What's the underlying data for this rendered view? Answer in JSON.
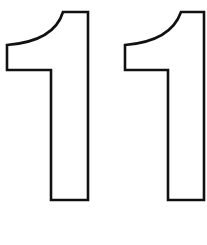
{
  "image": {
    "text": "11",
    "description": "Outlined number eleven, black stroke on white, coloring-page style",
    "colors": {
      "stroke": "#111111",
      "fill": "#ffffff",
      "background": "#ffffff"
    },
    "digits": [
      {
        "char": "1"
      },
      {
        "char": "1"
      }
    ]
  }
}
